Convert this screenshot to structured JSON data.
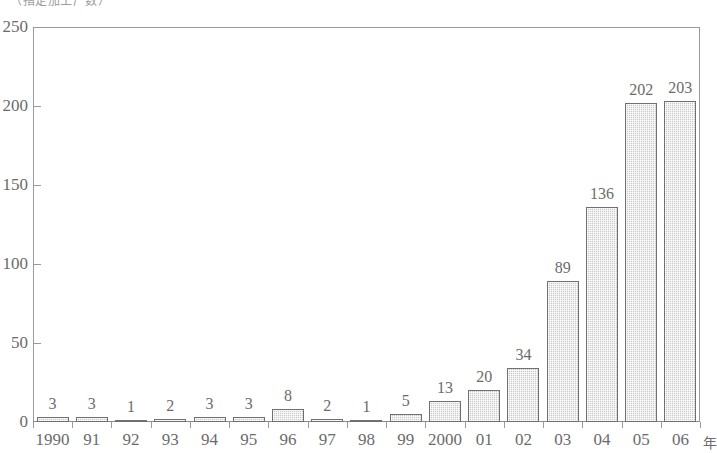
{
  "caption": "（指定加工厂数）",
  "chart_data": {
    "type": "bar",
    "title": "（指定加工厂数）",
    "xlabel": "年",
    "ylabel": "",
    "categories": [
      "1990",
      "91",
      "92",
      "93",
      "94",
      "95",
      "96",
      "97",
      "98",
      "99",
      "2000",
      "01",
      "02",
      "03",
      "04",
      "05",
      "06"
    ],
    "values": [
      3,
      3,
      1,
      2,
      3,
      3,
      8,
      2,
      1,
      5,
      13,
      20,
      34,
      89,
      136,
      202,
      203
    ],
    "yticks": [
      0,
      50,
      100,
      150,
      200,
      250
    ],
    "ylim": [
      0,
      250
    ],
    "grid": false,
    "legend": false,
    "bar_color": "#c9c9c9",
    "bar_edge_color": "#707070",
    "axis_color": "#9a9a9a",
    "text_color": "#6b6b6b",
    "background": "#ffffff",
    "x_unit_suffix": "年"
  }
}
